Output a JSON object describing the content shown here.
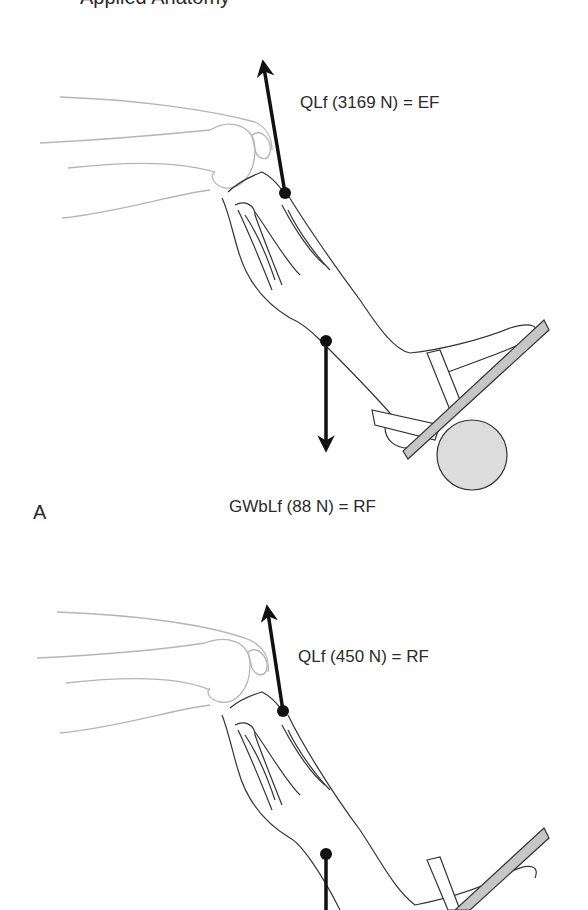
{
  "figure": {
    "title_cutoff": "Applied Anatomy",
    "panels": [
      {
        "letter": "A",
        "effort_label": "QLf (3169 N) = EF",
        "resistance_label": "GWbLf (88 N) = RF"
      },
      {
        "letter": "B",
        "effort_label": "QLf (450 N) = RF"
      }
    ],
    "colors": {
      "outline_light": "#b8b8b8",
      "outline_dark": "#333333",
      "arrow": "#111111",
      "sole_fill": "#c8c8c8",
      "ball_fill": "#dddddd"
    }
  }
}
